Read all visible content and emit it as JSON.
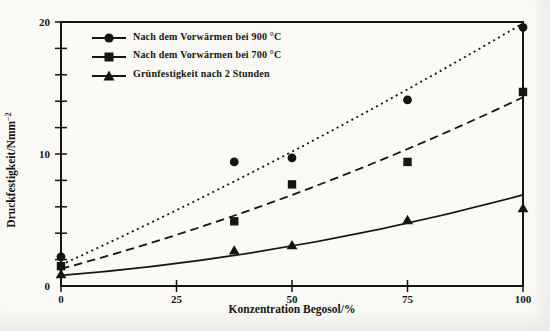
{
  "figure": {
    "background": "#fbfaf6",
    "ink": "#16150f"
  },
  "chart_data": {
    "type": "scatter",
    "title": "",
    "xlabel": "Konzentration Begosol/%",
    "ylabel_base": "Druckfestigkeit/Nmm",
    "ylabel_sup": "−2",
    "xlim": [
      0,
      100
    ],
    "ylim": [
      0,
      20
    ],
    "x_ticks": [
      0,
      25,
      50,
      75,
      100
    ],
    "y_major_ticks": [
      0,
      10,
      20
    ],
    "y_minor_step": 2,
    "grid": false,
    "legend_position": "top-left-inside",
    "series": [
      {
        "name": "Nach dem Vorwärmen bei 900 °C",
        "marker": "circle",
        "line_style": "dotted",
        "points": [
          [
            0,
            2.2
          ],
          [
            37.5,
            9.4
          ],
          [
            50,
            9.7
          ],
          [
            75,
            14.1
          ],
          [
            100,
            19.6
          ]
        ],
        "trend": {
          "start": [
            0,
            1.6
          ],
          "ctrl": [
            50,
            9.6
          ],
          "end": [
            100,
            19.9
          ]
        }
      },
      {
        "name": "Nach dem Vorwärmen bei 700 °C",
        "marker": "square",
        "line_style": "dashed",
        "points": [
          [
            0,
            1.5
          ],
          [
            37.5,
            4.9
          ],
          [
            50,
            7.7
          ],
          [
            75,
            9.4
          ],
          [
            100,
            14.7
          ]
        ],
        "trend": {
          "start": [
            0,
            1.3
          ],
          "ctrl": [
            50,
            6.0
          ],
          "end": [
            100,
            14.3
          ]
        }
      },
      {
        "name": "Grünfestigkeit nach 2 Stunden",
        "marker": "triangle",
        "line_style": "solid",
        "points": [
          [
            0,
            0.9
          ],
          [
            37.5,
            2.7
          ],
          [
            50,
            3.1
          ],
          [
            75,
            5.0
          ],
          [
            100,
            5.9
          ]
        ],
        "trend": {
          "start": [
            0,
            0.8
          ],
          "ctrl": [
            50,
            2.2
          ],
          "end": [
            100,
            6.9
          ]
        }
      }
    ]
  }
}
